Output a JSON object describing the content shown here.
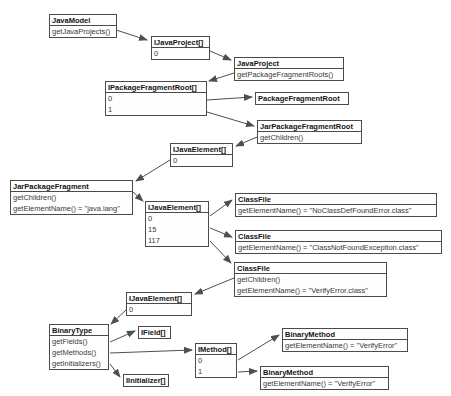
{
  "diagram": {
    "kind": "uml-object-diagram",
    "colors": {
      "background": "#ffffff",
      "box_fill": "#fefefe",
      "box_border": "#4b4b4b",
      "title_text": "#141414",
      "row_text": "#3a3a3a",
      "arrow": "#4f4f4f"
    },
    "boxes": [
      {
        "id": "java-model",
        "title": "JavaModel",
        "rows": [
          "getJavaProjects()"
        ],
        "x": 49,
        "y": 14,
        "w": 68
      },
      {
        "id": "ijavaproject-array",
        "title": "IJavaProject[]",
        "rows": [
          "0"
        ],
        "x": 151,
        "y": 36,
        "w": 59
      },
      {
        "id": "java-project",
        "title": "JavaProject",
        "rows": [
          "getPackageFragmentRoots()"
        ],
        "x": 234,
        "y": 57,
        "w": 110
      },
      {
        "id": "ipackagefragmentroot-array",
        "title": "IPackageFragmentRoot[]",
        "rows": [
          "0",
          "1"
        ],
        "x": 105,
        "y": 81,
        "w": 102
      },
      {
        "id": "package-fragment-root",
        "title": "PackageFragmentRoot",
        "rows": [],
        "x": 255,
        "y": 92,
        "w": 94
      },
      {
        "id": "jar-package-fragment-root",
        "title": "JarPackageFragmentRoot",
        "rows": [
          "getChildren()"
        ],
        "x": 257,
        "y": 120,
        "w": 105
      },
      {
        "id": "ijavaelement-array-1",
        "title": "IJavaElement[]",
        "rows": [
          "0"
        ],
        "x": 170,
        "y": 143,
        "w": 63
      },
      {
        "id": "jar-package-fragment",
        "title": "JarPackageFragment",
        "rows": [
          "getChildren()",
          "getElementName() = \"java.lang\""
        ],
        "x": 10,
        "y": 180,
        "w": 123
      },
      {
        "id": "ijavaelement-array-2",
        "title": "IJavaElement[]",
        "rows": [
          "0",
          "15",
          "117"
        ],
        "x": 145,
        "y": 201,
        "w": 64
      },
      {
        "id": "classfile-1",
        "title": "ClassFile",
        "rows": [
          "getElementName() = \"NoClassDefFoundError.class\""
        ],
        "x": 235,
        "y": 193,
        "w": 202
      },
      {
        "id": "classfile-2",
        "title": "ClassFile",
        "rows": [
          "getElementName() = \"ClassNotFoundException.class\""
        ],
        "x": 235,
        "y": 230,
        "w": 207
      },
      {
        "id": "classfile-3",
        "title": "ClassFile",
        "rows": [
          "getChildren()",
          "getElementName() = \"VerifyError.class\""
        ],
        "x": 234,
        "y": 262,
        "w": 153
      },
      {
        "id": "ijavaelement-array-3",
        "title": "IJavaElement[]",
        "rows": [
          "0"
        ],
        "x": 126,
        "y": 292,
        "w": 66
      },
      {
        "id": "binary-type",
        "title": "BinaryType",
        "rows": [
          "getFields()",
          "getMethods()",
          "getInitializers()"
        ],
        "x": 49,
        "y": 324,
        "w": 60
      },
      {
        "id": "ifield-array",
        "title": "IField[]",
        "rows": [],
        "x": 138,
        "y": 326,
        "w": 33
      },
      {
        "id": "imethod-array",
        "title": "IMethod[]",
        "rows": [
          "0",
          "1"
        ],
        "x": 195,
        "y": 343,
        "w": 42
      },
      {
        "id": "iinitializer-array",
        "title": "IInitializer[]",
        "rows": [],
        "x": 123,
        "y": 374,
        "w": 46
      },
      {
        "id": "binary-method-1",
        "title": "BinaryMethod",
        "rows": [
          "getElementName() = \"VerifyError\""
        ],
        "x": 282,
        "y": 328,
        "w": 126
      },
      {
        "id": "binary-method-2",
        "title": "BinaryMethod",
        "rows": [
          "getElementName() = \"VerifyError\""
        ],
        "x": 260,
        "y": 366,
        "w": 129
      }
    ],
    "arrows": [
      {
        "from": "java-model",
        "to": "ijavaproject-array",
        "x1": 113,
        "y1": 29,
        "x2": 147,
        "y2": 40
      },
      {
        "from": "ijavaproject-array",
        "to": "java-project",
        "x1": 210,
        "y1": 51,
        "x2": 231,
        "y2": 60
      },
      {
        "from": "java-project",
        "to": "ipackagefragmentroot-array",
        "x1": 234,
        "y1": 73,
        "x2": 209,
        "y2": 81
      },
      {
        "from": "ipackagefragmentroot-array",
        "to": "package-fragment-root",
        "x1": 207,
        "y1": 100,
        "x2": 252,
        "y2": 97
      },
      {
        "from": "ipackagefragmentroot-array",
        "to": "jar-package-fragment-root",
        "x1": 207,
        "y1": 112,
        "x2": 254,
        "y2": 126
      },
      {
        "from": "jar-package-fragment-root",
        "to": "ijavaelement-array-1",
        "x1": 257,
        "y1": 137,
        "x2": 236,
        "y2": 146
      },
      {
        "from": "ijavaelement-array-1",
        "to": "jar-package-fragment",
        "x1": 170,
        "y1": 160,
        "x2": 136,
        "y2": 181
      },
      {
        "from": "jar-package-fragment",
        "to": "ijavaelement-array-2",
        "x1": 133,
        "y1": 192,
        "x2": 143,
        "y2": 201
      },
      {
        "from": "ijavaelement-array-2",
        "to": "classfile-1",
        "x1": 210,
        "y1": 216,
        "x2": 232,
        "y2": 200
      },
      {
        "from": "ijavaelement-array-2",
        "to": "classfile-2",
        "x1": 210,
        "y1": 228,
        "x2": 232,
        "y2": 237
      },
      {
        "from": "ijavaelement-array-2",
        "to": "classfile-3",
        "x1": 210,
        "y1": 241,
        "x2": 231,
        "y2": 263
      },
      {
        "from": "classfile-3",
        "to": "ijavaelement-array-3",
        "x1": 234,
        "y1": 278,
        "x2": 195,
        "y2": 294
      },
      {
        "from": "ijavaelement-array-3",
        "to": "binary-type",
        "x1": 126,
        "y1": 310,
        "x2": 111,
        "y2": 324
      },
      {
        "from": "binary-type",
        "to": "ifield-array",
        "x1": 110,
        "y1": 342,
        "x2": 135,
        "y2": 331
      },
      {
        "from": "binary-type",
        "to": "imethod-array",
        "x1": 110,
        "y1": 353,
        "x2": 192,
        "y2": 350
      },
      {
        "from": "binary-type",
        "to": "iinitializer-array",
        "x1": 110,
        "y1": 364,
        "x2": 120,
        "y2": 377
      },
      {
        "from": "imethod-array",
        "to": "binary-method-1",
        "x1": 238,
        "y1": 360,
        "x2": 279,
        "y2": 335
      },
      {
        "from": "imethod-array",
        "to": "binary-method-2",
        "x1": 238,
        "y1": 372,
        "x2": 257,
        "y2": 371
      }
    ]
  }
}
